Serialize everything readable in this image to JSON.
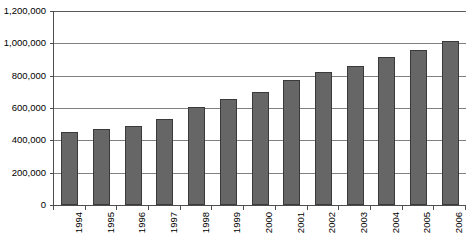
{
  "chart_data": {
    "type": "bar",
    "title": "",
    "xlabel": "",
    "ylabel": "",
    "categories": [
      "1994",
      "1995",
      "1996",
      "1997",
      "1998",
      "1999",
      "2000",
      "2001",
      "2002",
      "2003",
      "2004",
      "2005",
      "2006"
    ],
    "values": [
      450000,
      470000,
      490000,
      530000,
      605000,
      655000,
      700000,
      775000,
      820000,
      860000,
      915000,
      960000,
      1015000
    ],
    "ylim": [
      0,
      1200000
    ],
    "ytick_values": [
      0,
      200000,
      400000,
      600000,
      800000,
      1000000,
      1200000
    ],
    "ytick_labels": [
      "0",
      "200,000",
      "400,000",
      "600,000",
      "800,000",
      "1,000,000",
      "1,200,000"
    ],
    "grid": true,
    "grid_axis": "y",
    "legend": false,
    "legend_position": "none",
    "bar_color": "#666666",
    "bar_border_color": "#3a3a3a",
    "gridline_color": "#808080",
    "axis_color": "#4d4d4d",
    "background_color": "#ffffff",
    "xtick_label_rotation": 90
  }
}
